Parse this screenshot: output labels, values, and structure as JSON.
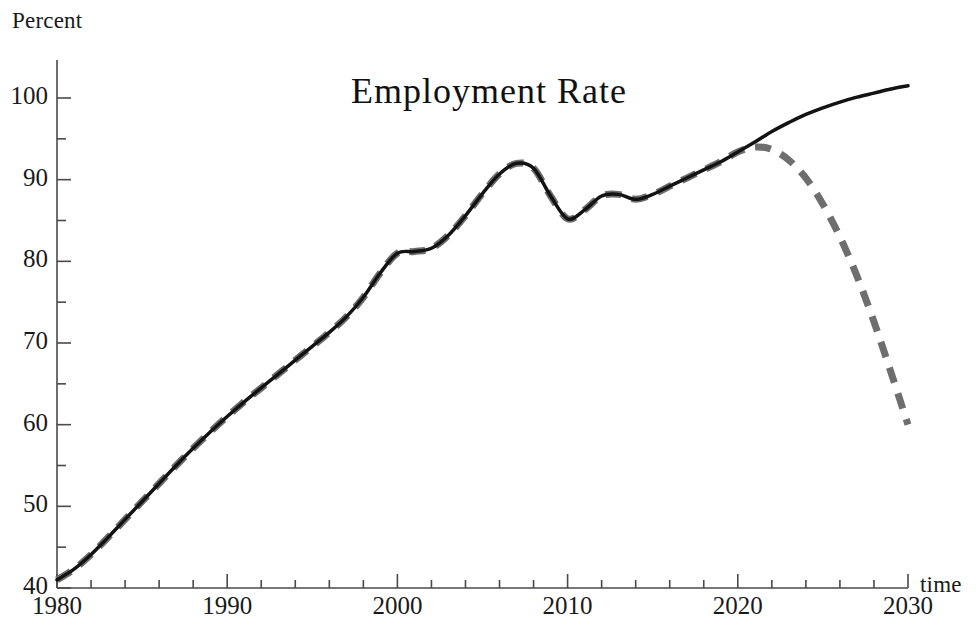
{
  "figure": {
    "title": "Employment  Rate",
    "background": "#ffffff",
    "width": 978,
    "height": 630
  },
  "axes": {
    "y_unit_label": "Percent",
    "x_unit_label": "time",
    "y_ticks": [
      40,
      50,
      60,
      70,
      80,
      90,
      100
    ],
    "y_tick_labels": [
      "40",
      "50",
      "60",
      "70",
      "80",
      "90",
      "100"
    ],
    "x_ticks": [
      1980,
      1990,
      2000,
      2010,
      2020,
      2030
    ],
    "x_tick_labels": [
      "1980",
      "1990",
      "2000",
      "2010",
      "2020",
      "2030"
    ],
    "y_minor_step": 5,
    "x_minor_step": 2,
    "axis_color": "#4a4a4a"
  },
  "colors": {
    "historical_line": "#131313",
    "projection_line": "#6e6e6e",
    "axis": "#4a4a4a",
    "text": "#1a1a1a"
  },
  "chart_data": {
    "type": "line",
    "title": "Employment  Rate",
    "xlabel": "time",
    "ylabel": "Percent",
    "xlim": [
      1980,
      2030
    ],
    "ylim": [
      40,
      103
    ],
    "grid": false,
    "legend": "none",
    "series": [
      {
        "name": "Employment rate (solid, baseline/trend)",
        "style": "solid",
        "color": "#131313",
        "width": 3.5,
        "x": [
          1980,
          1981,
          1982,
          1983,
          1984,
          1985,
          1986,
          1987,
          1988,
          1989,
          1990,
          1991,
          1992,
          1993,
          1994,
          1995,
          1996,
          1997,
          1998,
          1999,
          2000,
          2001,
          2002,
          2003,
          2004,
          2005,
          2006,
          2007,
          2008,
          2009,
          2010,
          2011,
          2012,
          2013,
          2014,
          2015,
          2016,
          2017,
          2018,
          2019,
          2020,
          2021,
          2022,
          2023,
          2024,
          2025,
          2026,
          2027,
          2028,
          2029,
          2030
        ],
        "y": [
          41.0,
          42.3,
          44.1,
          46.2,
          48.4,
          50.6,
          52.8,
          55.0,
          57.1,
          59.1,
          61.0,
          62.8,
          64.5,
          66.2,
          67.9,
          69.6,
          71.3,
          73.2,
          75.6,
          78.6,
          81.0,
          81.2,
          81.6,
          83.2,
          85.6,
          88.3,
          90.7,
          92.0,
          91.4,
          88.0,
          85.2,
          86.3,
          88.0,
          88.2,
          87.6,
          88.2,
          89.2,
          90.2,
          91.2,
          92.2,
          93.4,
          94.6,
          95.9,
          97.0,
          98.0,
          98.8,
          99.5,
          100.1,
          100.6,
          101.1,
          101.5
        ]
      },
      {
        "name": "Employment rate (dashed, projection/scenario)",
        "style": "dashed",
        "color": "#6e6e6e",
        "width": 7,
        "x": [
          1980,
          1981,
          1982,
          1983,
          1984,
          1985,
          1986,
          1987,
          1988,
          1989,
          1990,
          1991,
          1992,
          1993,
          1994,
          1995,
          1996,
          1997,
          1998,
          1999,
          2000,
          2001,
          2002,
          2003,
          2004,
          2005,
          2006,
          2007,
          2008,
          2009,
          2010,
          2011,
          2012,
          2013,
          2014,
          2015,
          2016,
          2017,
          2018,
          2019,
          2020,
          2021,
          2022,
          2023,
          2024,
          2025,
          2026,
          2027,
          2028,
          2029,
          2030
        ],
        "y": [
          41.0,
          42.3,
          44.1,
          46.2,
          48.4,
          50.6,
          52.8,
          55.0,
          57.1,
          59.1,
          61.0,
          62.8,
          64.5,
          66.2,
          67.9,
          69.6,
          71.3,
          73.2,
          75.6,
          78.6,
          81.0,
          81.2,
          81.6,
          83.2,
          85.6,
          88.3,
          90.7,
          92.0,
          91.4,
          88.0,
          85.2,
          86.3,
          88.0,
          88.2,
          87.6,
          88.2,
          89.2,
          90.2,
          91.2,
          92.2,
          93.4,
          94.0,
          93.7,
          92.4,
          90.2,
          87.0,
          83.0,
          78.2,
          72.6,
          66.4,
          60.0
        ]
      }
    ]
  }
}
